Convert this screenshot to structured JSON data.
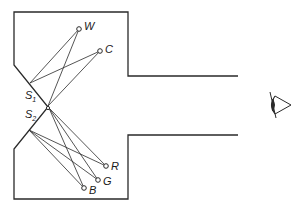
{
  "diagram": {
    "title": "",
    "colors": {
      "stroke": "#2a2a2a",
      "background": "#ffffff"
    },
    "sources": [
      {
        "id": "S1",
        "label": "S",
        "subscript": "1"
      },
      {
        "id": "S2",
        "label": "S",
        "subscript": "2"
      }
    ],
    "points_upper": [
      {
        "id": "W",
        "label": "W"
      },
      {
        "id": "C",
        "label": "C"
      }
    ],
    "points_lower": [
      {
        "id": "R",
        "label": "R"
      },
      {
        "id": "G",
        "label": "G"
      },
      {
        "id": "B",
        "label": "B"
      }
    ],
    "observer": {
      "icon": "eye-icon"
    }
  }
}
